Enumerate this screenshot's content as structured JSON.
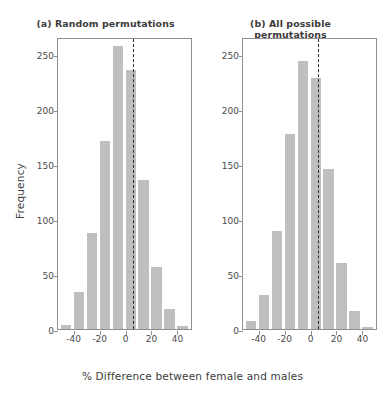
{
  "figure": {
    "xlabel": "% Difference between female and males",
    "ylabel": "Frequency",
    "bar_color": "#bfbfbf",
    "axis_color": "#8e8e8e",
    "refline_color": "#2c2c2c"
  },
  "chart_data": [
    {
      "type": "bar",
      "title": "(a) Random permutations",
      "xlabel": "% Difference between female and males",
      "ylabel": "Frequency",
      "categories": [
        -45,
        -35,
        -25,
        -15,
        -5,
        5,
        15,
        25,
        35,
        45
      ],
      "values": [
        4,
        34,
        87,
        171,
        257,
        235,
        135,
        56,
        18,
        3
      ],
      "bin_width": 10,
      "xlim": [
        -52,
        52
      ],
      "ylim": [
        0,
        265
      ],
      "xticks": [
        -40,
        -20,
        0,
        20,
        40
      ],
      "yticks": [
        0,
        50,
        100,
        150,
        200,
        250
      ],
      "grid": false,
      "legend": "none",
      "annotations": [
        {
          "type": "vline",
          "x": 6,
          "style": "dashed",
          "label": "observed difference"
        }
      ]
    },
    {
      "type": "bar",
      "title": "(b) All possible permutations",
      "xlabel": "% Difference between female and males",
      "ylabel": "Frequency",
      "categories": [
        -45,
        -35,
        -25,
        -15,
        -5,
        5,
        15,
        25,
        35,
        45
      ],
      "values": [
        7,
        31,
        89,
        177,
        243,
        228,
        145,
        60,
        16,
        2
      ],
      "bin_width": 10,
      "xlim": [
        -52,
        52
      ],
      "ylim": [
        0,
        265
      ],
      "xticks": [
        -40,
        -20,
        0,
        20,
        40
      ],
      "yticks": [
        0,
        50,
        100,
        150,
        200,
        250
      ],
      "grid": false,
      "legend": "none",
      "annotations": [
        {
          "type": "vline",
          "x": 6,
          "style": "dashed",
          "label": "observed difference"
        }
      ]
    }
  ]
}
